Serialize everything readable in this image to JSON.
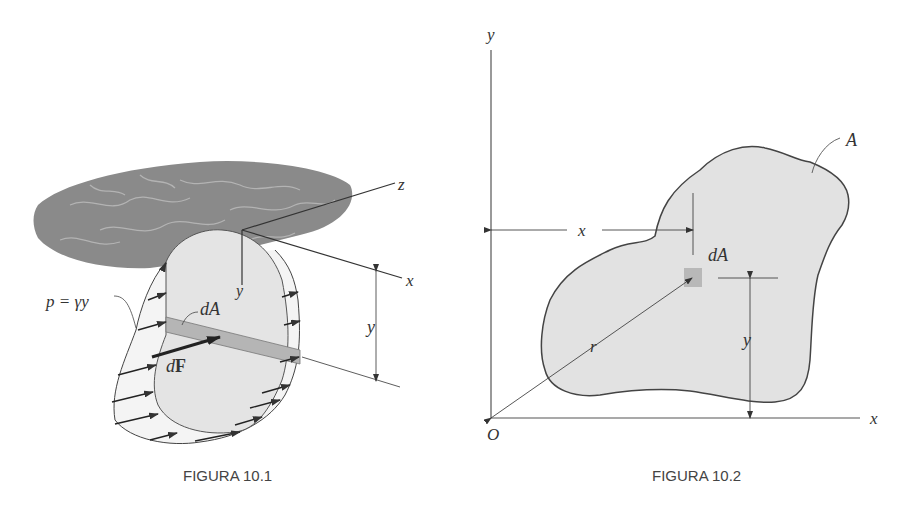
{
  "figures": [
    {
      "caption": "FIGURA 10.1",
      "labels": {
        "axis_z": "z",
        "axis_x": "x",
        "axis_y": "y",
        "depth_y": "y",
        "pressure": "p = γy",
        "element_area": "dA",
        "force_d": "d",
        "force_F": "F"
      }
    },
    {
      "caption": "FIGURA 10.2",
      "labels": {
        "axis_y": "y",
        "axis_x": "x",
        "origin": "O",
        "area": "A",
        "element_area": "dA",
        "dist_x": "x",
        "dist_y": "y",
        "radius": "r"
      }
    }
  ],
  "colors": {
    "surface": "#8a8a8a",
    "surface_vein": "#b8b8b8",
    "plate_fill": "#e4e4e4",
    "strip_fill": "#b5b5b5",
    "area_fill": "#e2e2e2",
    "line": "#444444"
  }
}
